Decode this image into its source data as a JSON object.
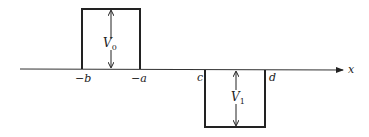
{
  "diagram": {
    "axis": {
      "label": "x"
    },
    "barrier": {
      "height_label_main": "V",
      "height_label_sub": "0",
      "left_label": "−b",
      "right_label": "−a"
    },
    "well": {
      "depth_label_main": "V",
      "depth_label_sub": "1",
      "left_label": "c",
      "right_label": "d"
    },
    "colors": {
      "stroke": "#222222",
      "background": "#ffffff"
    }
  }
}
